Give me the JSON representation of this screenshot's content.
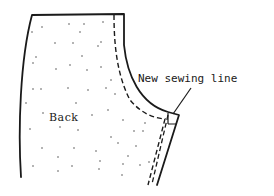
{
  "diagram": {
    "labels": {
      "piece": "Back",
      "annotation": "New sewing line"
    },
    "colors": {
      "ink": "#1a1a1a",
      "background": "#ffffff",
      "dots": "#555555"
    },
    "elements": [
      {
        "name": "pattern-piece-outline",
        "style": "solid"
      },
      {
        "name": "original-seam-line",
        "style": "dashed"
      },
      {
        "name": "new-sewing-line",
        "style": "dashed"
      },
      {
        "name": "leader-line",
        "style": "solid"
      }
    ]
  }
}
